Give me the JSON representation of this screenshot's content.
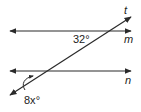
{
  "diagram": {
    "type": "parallel lines cut by a transversal",
    "lines": [
      {
        "name": "t",
        "label": "t",
        "kind": "transversal"
      },
      {
        "name": "m",
        "label": "m",
        "kind": "parallel"
      },
      {
        "name": "n",
        "label": "n",
        "kind": "parallel"
      }
    ],
    "angles": [
      {
        "label": "32°",
        "at": "intersection of t and m"
      },
      {
        "label_var": "8x",
        "label": "8x°",
        "at": "intersection of t and n"
      }
    ]
  },
  "labels": {
    "t": "t",
    "m": "m",
    "n": "n",
    "angle_top": "32°",
    "angle_bottom_var": "8x",
    "angle_bottom_deg": "°"
  },
  "colors": {
    "stroke": "#2a2a2a",
    "text": "#222222"
  }
}
